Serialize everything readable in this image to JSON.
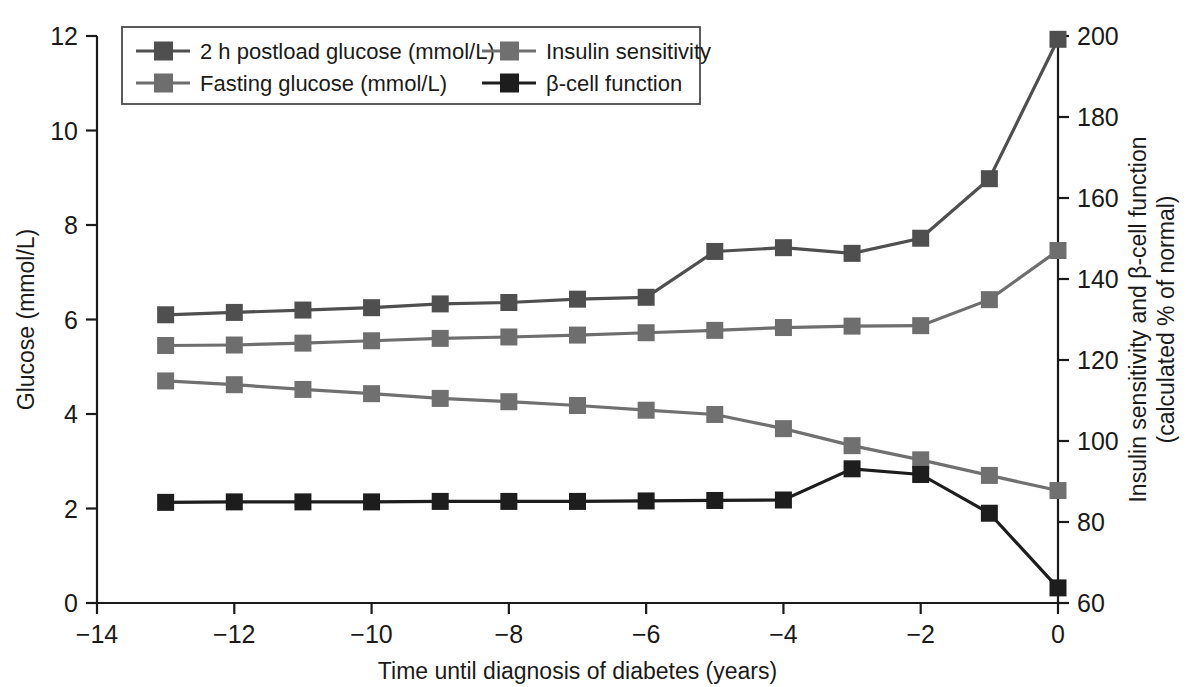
{
  "chart_data": {
    "type": "line",
    "title": "",
    "xlabel": "Time until diagnosis of diabetes (years)",
    "ylabel": "Glucose (mmol/L)",
    "ylabel_right_line1": "Insulin sensitivity and β-cell function",
    "ylabel_right_line2": "(calculated % of normal)",
    "xlim": [
      -14,
      0
    ],
    "ylim": [
      0,
      12
    ],
    "ylim_right": [
      60,
      200
    ],
    "xticks": [
      -14,
      -12,
      -10,
      -8,
      -6,
      -4,
      -2,
      0
    ],
    "xtick_labels": [
      "−14",
      "−12",
      "−10",
      "−8",
      "−6",
      "−4",
      "−2",
      "0"
    ],
    "yticks": [
      0,
      2,
      4,
      6,
      8,
      10,
      12
    ],
    "ytick_labels": [
      "0",
      "2",
      "4",
      "6",
      "8",
      "10",
      "12"
    ],
    "yticks_right": [
      60,
      80,
      100,
      120,
      140,
      160,
      180,
      200
    ],
    "ytick_labels_right": [
      "60",
      "80",
      "100",
      "120",
      "140",
      "160",
      "180",
      "200"
    ],
    "grid": false,
    "legend_position": "top-left",
    "x": [
      -13,
      -12,
      -11,
      -10,
      -9,
      -8,
      -7,
      -6,
      -5,
      -4,
      -3,
      -2,
      -1,
      0
    ],
    "series": [
      {
        "name": "2 h postload glucose (mmol/L)",
        "axis": "left",
        "color": "#4f4f4f",
        "marker": "square",
        "values": [
          6.1,
          6.15,
          6.2,
          6.25,
          6.33,
          6.36,
          6.43,
          6.47,
          7.44,
          7.52,
          7.4,
          7.72,
          8.98,
          11.93
        ]
      },
      {
        "name": "Fasting glucose (mmol/L)",
        "axis": "left",
        "color": "#6e6e6e",
        "marker": "square",
        "values": [
          5.45,
          5.46,
          5.5,
          5.55,
          5.6,
          5.63,
          5.67,
          5.72,
          5.77,
          5.83,
          5.86,
          5.87,
          6.42,
          7.46
        ]
      },
      {
        "name": "Insulin sensitivity",
        "axis": "right",
        "color": "#707070",
        "marker": "square",
        "values_left_scale": [
          4.7,
          4.62,
          4.52,
          4.43,
          4.33,
          4.26,
          4.18,
          4.08,
          3.99,
          3.69,
          3.33,
          3.03,
          2.7,
          2.38
        ],
        "values": [
          115,
          114,
          113,
          112,
          111,
          110,
          109,
          108,
          107,
          103,
          99,
          95,
          92,
          88
        ]
      },
      {
        "name": "β-cell function",
        "axis": "right",
        "color": "#1d1d1d",
        "marker": "square",
        "values_left_scale": [
          2.13,
          2.14,
          2.14,
          2.14,
          2.15,
          2.15,
          2.15,
          2.16,
          2.17,
          2.18,
          2.84,
          2.72,
          1.9,
          0.32
        ],
        "values": [
          82,
          82,
          82,
          82,
          82,
          82,
          82,
          82,
          83,
          83,
          91,
          90,
          81,
          63
        ]
      }
    ],
    "legend_entries": [
      "2 h postload glucose (mmol/L)",
      "Fasting glucose (mmol/L)",
      "Insulin sensitivity",
      "β-cell function"
    ]
  }
}
